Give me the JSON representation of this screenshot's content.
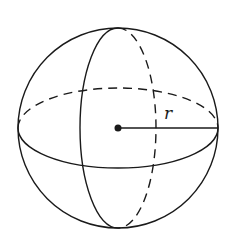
{
  "diagram": {
    "type": "sphere",
    "labels": {
      "radius": "r"
    },
    "colors": {
      "stroke": "#1a1a1a",
      "background": "#ffffff"
    }
  }
}
